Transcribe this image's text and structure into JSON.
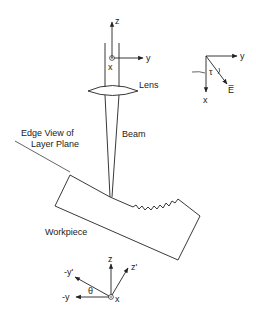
{
  "diagram": {
    "labels": {
      "lens": "Lens",
      "beam": "Beam",
      "layer_plane_line1": "Edge View of",
      "layer_plane_line2": "Layer Plane",
      "workpiece": "Workpiece"
    },
    "top_axes": {
      "z": "z",
      "y": "y",
      "x": "x"
    },
    "polarization_axes": {
      "y": "y",
      "x": "x",
      "angle": "τ",
      "field": "E̅"
    },
    "bottom_axes": {
      "z": "z",
      "z_prime": "z'",
      "neg_y_prime": "-y'",
      "neg_y": "-y",
      "theta": "θ",
      "x": "x"
    }
  },
  "colors": {
    "line": "#222222",
    "background": "#ffffff"
  }
}
